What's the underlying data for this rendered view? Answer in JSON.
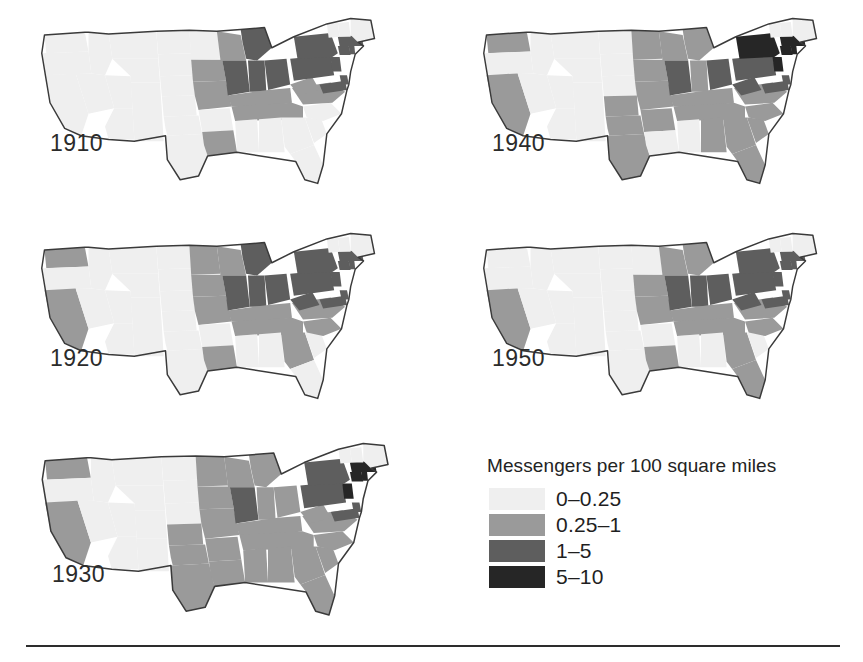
{
  "figure": {
    "background_color": "#ffffff",
    "rule_color": "#2d2d2d"
  },
  "legend": {
    "title": "Messengers per 100 square miles",
    "entries": [
      {
        "label": "0–0.25",
        "color": "#efefef",
        "swatch_name": "swatch-0-025"
      },
      {
        "label": "0.25–1",
        "color": "#9a9a9a",
        "swatch_name": "swatch-025-1"
      },
      {
        "label": "1–5",
        "color": "#5e5e5e",
        "swatch_name": "swatch-1-5"
      },
      {
        "label": "5–10",
        "color": "#262626",
        "swatch_name": "swatch-5-10"
      }
    ]
  },
  "panels": [
    {
      "year": "1910"
    },
    {
      "year": "1940"
    },
    {
      "year": "1920"
    },
    {
      "year": "1950"
    },
    {
      "year": "1930"
    }
  ],
  "chart_data": {
    "type": "map",
    "title": "Messengers per 100 square miles",
    "subtitle": "",
    "xlabel": "",
    "ylabel": "",
    "map_region": "Contiguous United States",
    "projection": "simplified state outlines",
    "small_multiples": true,
    "panel_years": [
      "1910",
      "1920",
      "1930",
      "1940",
      "1950"
    ],
    "panel_layout": "2 columns × 3 rows; 1910 top-left, 1940 top-right, 1920 middle-left, 1950 middle-right, 1930 bottom-left, legend bottom-right",
    "legend_position": "bottom-right",
    "grid": false,
    "units": "messengers per 100 square miles",
    "classes": [
      {
        "label": "0–0.25",
        "min": 0,
        "max": 0.25,
        "color": "#efefef"
      },
      {
        "label": "0.25–1",
        "min": 0.25,
        "max": 1,
        "color": "#9a9a9a"
      },
      {
        "label": "1–5",
        "min": 1,
        "max": 5,
        "color": "#5e5e5e"
      },
      {
        "label": "5–10",
        "min": 5,
        "max": 10,
        "color": "#262626"
      }
    ],
    "series": [
      {
        "name": "1910",
        "values": {
          "WA": "0–0.25",
          "OR": "0–0.25",
          "CA": "0–0.25",
          "ID": "0–0.25",
          "NV": "0–0.25",
          "UT": "0–0.25",
          "AZ": "0–0.25",
          "MT": "0–0.25",
          "WY": "0–0.25",
          "CO": "0–0.25",
          "NM": "0–0.25",
          "ND": "0–0.25",
          "SD": "0–0.25",
          "NE": "0–0.25",
          "KS": "0–0.25",
          "OK": "0–0.25",
          "TX": "0–0.25",
          "MN": "0–0.25",
          "IA": "0.25–1",
          "MO": "0.25–1",
          "AR": "0–0.25",
          "LA": "0.25–1",
          "WI": "0.25–1",
          "IL": "1–5",
          "MI": "1–5",
          "IN": "1–5",
          "OH": "1–5",
          "KY": "0.25–1",
          "TN": "0.25–1",
          "MS": "0–0.25",
          "AL": "0–0.25",
          "GA": "0–0.25",
          "FL": "0–0.25",
          "SC": "0–0.25",
          "NC": "0–0.25",
          "VA": "0.25–1",
          "WV": "0.25–1",
          "PA": "1–5",
          "NY": "1–5",
          "NJ": "1–5",
          "MD": "1–5",
          "DE": "1–5",
          "CT": "1–5",
          "RI": "1–5",
          "MA": "1–5",
          "VT": "0–0.25",
          "NH": "0–0.25",
          "ME": "0–0.25"
        }
      },
      {
        "name": "1920",
        "values": {
          "WA": "0.25–1",
          "OR": "0–0.25",
          "CA": "0.25–1",
          "ID": "0–0.25",
          "NV": "0–0.25",
          "UT": "0–0.25",
          "AZ": "0–0.25",
          "MT": "0–0.25",
          "WY": "0–0.25",
          "CO": "0–0.25",
          "NM": "0–0.25",
          "ND": "0–0.25",
          "SD": "0–0.25",
          "NE": "0–0.25",
          "KS": "0–0.25",
          "OK": "0–0.25",
          "TX": "0–0.25",
          "MN": "0.25–1",
          "IA": "0.25–1",
          "MO": "0.25–1",
          "AR": "0–0.25",
          "LA": "0.25–1",
          "WI": "0.25–1",
          "IL": "1–5",
          "MI": "1–5",
          "IN": "1–5",
          "OH": "1–5",
          "KY": "0.25–1",
          "TN": "0.25–1",
          "MS": "0–0.25",
          "AL": "0–0.25",
          "GA": "0.25–1",
          "FL": "0–0.25",
          "SC": "0–0.25",
          "NC": "0.25–1",
          "VA": "0.25–1",
          "WV": "1–5",
          "PA": "1–5",
          "NY": "1–5",
          "NJ": "1–5",
          "MD": "1–5",
          "DE": "1–5",
          "CT": "1–5",
          "RI": "1–5",
          "MA": "1–5",
          "VT": "0–0.25",
          "NH": "0–0.25",
          "ME": "0–0.25"
        }
      },
      {
        "name": "1930",
        "values": {
          "WA": "0.25–1",
          "OR": "0–0.25",
          "CA": "0.25–1",
          "ID": "0–0.25",
          "NV": "0–0.25",
          "UT": "0–0.25",
          "AZ": "0–0.25",
          "MT": "0–0.25",
          "WY": "0–0.25",
          "CO": "0–0.25",
          "NM": "0–0.25",
          "ND": "0–0.25",
          "SD": "0–0.25",
          "NE": "0–0.25",
          "KS": "0.25–1",
          "OK": "0.25–1",
          "TX": "0.25–1",
          "MN": "0.25–1",
          "IA": "0.25–1",
          "MO": "0.25–1",
          "AR": "0.25–1",
          "LA": "0.25–1",
          "WI": "0.25–1",
          "IL": "1–5",
          "MI": "0.25–1",
          "IN": "0.25–1",
          "OH": "0.25–1",
          "KY": "0.25–1",
          "TN": "0.25–1",
          "MS": "0.25–1",
          "AL": "0.25–1",
          "GA": "0.25–1",
          "FL": "0.25–1",
          "SC": "0.25–1",
          "NC": "0.25–1",
          "VA": "0.25–1",
          "WV": "0.25–1",
          "PA": "1–5",
          "NY": "1–5",
          "NJ": "5–10",
          "MD": "1–5",
          "DE": "1–5",
          "CT": "5–10",
          "RI": "5–10",
          "MA": "5–10",
          "VT": "0–0.25",
          "NH": "0–0.25",
          "ME": "0–0.25"
        }
      },
      {
        "name": "1940",
        "values": {
          "WA": "0.25–1",
          "OR": "0–0.25",
          "CA": "0.25–1",
          "ID": "0–0.25",
          "NV": "0–0.25",
          "UT": "0–0.25",
          "AZ": "0–0.25",
          "MT": "0–0.25",
          "WY": "0–0.25",
          "CO": "0–0.25",
          "NM": "0–0.25",
          "ND": "0–0.25",
          "SD": "0–0.25",
          "NE": "0–0.25",
          "KS": "0.25–1",
          "OK": "0.25–1",
          "TX": "0.25–1",
          "MN": "0.25–1",
          "IA": "0.25–1",
          "MO": "0.25–1",
          "AR": "0.25–1",
          "LA": "0–0.25",
          "WI": "0.25–1",
          "IL": "1–5",
          "MI": "0.25–1",
          "IN": "0.25–1",
          "OH": "1–5",
          "KY": "0.25–1",
          "TN": "0.25–1",
          "MS": "0–0.25",
          "AL": "0.25–1",
          "GA": "0.25–1",
          "FL": "0.25–1",
          "SC": "0.25–1",
          "NC": "0.25–1",
          "VA": "0.25–1",
          "WV": "1–5",
          "PA": "1–5",
          "NY": "5–10",
          "NJ": "5–10",
          "MD": "1–5",
          "DE": "1–5",
          "CT": "5–10",
          "RI": "5–10",
          "MA": "5–10",
          "VT": "0–0.25",
          "NH": "0–0.25",
          "ME": "0–0.25"
        }
      },
      {
        "name": "1950",
        "values": {
          "WA": "0–0.25",
          "OR": "0–0.25",
          "CA": "0.25–1",
          "ID": "0–0.25",
          "NV": "0–0.25",
          "UT": "0–0.25",
          "AZ": "0–0.25",
          "MT": "0–0.25",
          "WY": "0–0.25",
          "CO": "0–0.25",
          "NM": "0–0.25",
          "ND": "0–0.25",
          "SD": "0–0.25",
          "NE": "0–0.25",
          "KS": "0–0.25",
          "OK": "0–0.25",
          "TX": "0–0.25",
          "MN": "0–0.25",
          "IA": "0.25–1",
          "MO": "0.25–1",
          "AR": "0–0.25",
          "LA": "0.25–1",
          "WI": "0.25–1",
          "IL": "1–5",
          "MI": "0.25–1",
          "IN": "1–5",
          "OH": "1–5",
          "KY": "0.25–1",
          "TN": "0.25–1",
          "MS": "0–0.25",
          "AL": "0–0.25",
          "GA": "0.25–1",
          "FL": "0.25–1",
          "SC": "0–0.25",
          "NC": "0.25–1",
          "VA": "0.25–1",
          "WV": "1–5",
          "PA": "1–5",
          "NY": "1–5",
          "NJ": "1–5",
          "MD": "1–5",
          "DE": "1–5",
          "CT": "1–5",
          "RI": "1–5",
          "MA": "1–5",
          "VT": "0–0.25",
          "NH": "0–0.25",
          "ME": "0–0.25"
        }
      }
    ]
  }
}
